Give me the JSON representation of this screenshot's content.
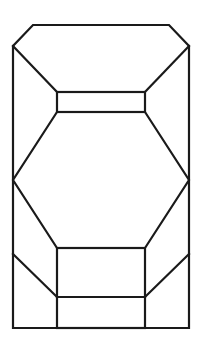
{
  "diagram": {
    "title": "",
    "stroke_color": "#1a1a1a",
    "background_color": "#ffffff",
    "stroke_width": 2.2,
    "outline": {
      "points": [
        [
          33,
          25
        ],
        [
          169,
          25
        ],
        [
          189,
          46
        ],
        [
          189,
          328
        ],
        [
          13,
          328
        ],
        [
          13,
          46
        ]
      ]
    },
    "top_rect": {
      "x1": 57,
      "y1": 92,
      "x2": 145,
      "y2": 112
    },
    "top_diagonals": [
      {
        "from": [
          13,
          46
        ],
        "to": [
          57,
          92
        ]
      },
      {
        "from": [
          189,
          46
        ],
        "to": [
          145,
          92
        ]
      }
    ],
    "hexagon": {
      "points": [
        [
          57,
          112
        ],
        [
          145,
          112
        ],
        [
          189,
          180
        ],
        [
          145,
          248
        ],
        [
          57,
          248
        ],
        [
          13,
          180
        ]
      ]
    },
    "bottom_rect": {
      "x1": 57,
      "y1": 248,
      "x2": 145,
      "y2": 328
    },
    "bottom_divider": {
      "from": [
        57,
        297
      ],
      "to": [
        145,
        297
      ]
    },
    "bottom_diagonals": [
      {
        "from": [
          13,
          254
        ],
        "to": [
          57,
          297
        ]
      },
      {
        "from": [
          189,
          254
        ],
        "to": [
          145,
          297
        ]
      }
    ]
  }
}
